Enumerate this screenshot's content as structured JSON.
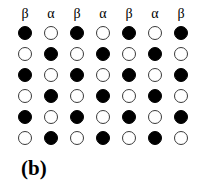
{
  "figure": {
    "caption": "(b)",
    "caption_x": 21,
    "caption_y": 158,
    "width": 207,
    "height": 184,
    "background_color": "#ffffff"
  },
  "lattice": {
    "columns": 7,
    "rows": 6,
    "column_labels": [
      "β",
      "α",
      "β",
      "α",
      "β",
      "α",
      "β"
    ],
    "column_centers_x": [
      25,
      51,
      77,
      103,
      129,
      155,
      181
    ],
    "row_centers_y": [
      33,
      54,
      75,
      96,
      117,
      138
    ],
    "label_y": 6,
    "site_diameter": 14,
    "filled_color": "#000000",
    "hollow_fill_color": "#ffffff",
    "hollow_stroke_color": "#3a3a3a",
    "states": [
      [
        "filled",
        "hollow",
        "filled",
        "hollow",
        "filled",
        "hollow",
        "filled"
      ],
      [
        "hollow",
        "filled",
        "hollow",
        "filled",
        "hollow",
        "filled",
        "hollow"
      ],
      [
        "filled",
        "hollow",
        "filled",
        "hollow",
        "filled",
        "hollow",
        "filled"
      ],
      [
        "hollow",
        "filled",
        "hollow",
        "filled",
        "hollow",
        "filled",
        "hollow"
      ],
      [
        "filled",
        "hollow",
        "filled",
        "hollow",
        "filled",
        "hollow",
        "filled"
      ],
      [
        "hollow",
        "filled",
        "hollow",
        "filled",
        "hollow",
        "filled",
        "hollow"
      ]
    ]
  }
}
